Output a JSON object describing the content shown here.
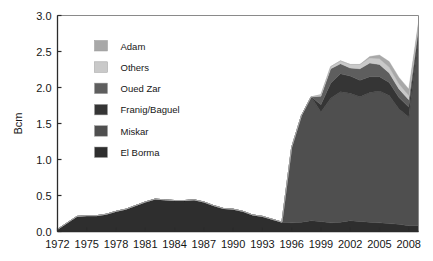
{
  "figure": {
    "background_color": "#ffffff",
    "frame_color": "#8a8a8a",
    "axis_color": "#2b2b2b"
  },
  "chart_data": {
    "type": "area",
    "stacked": true,
    "title": "",
    "subtitle": "",
    "xlabel": "",
    "ylabel": "Bcm",
    "grid": false,
    "legend_position": "upper-left-inside",
    "xlim": [
      1972,
      2009
    ],
    "ylim": [
      0.0,
      3.0
    ],
    "ytick_labels": [
      "0.0",
      "0.5",
      "1.0",
      "1.5",
      "2.0",
      "2.5",
      "3.0"
    ],
    "ytick_values": [
      0.0,
      0.5,
      1.0,
      1.5,
      2.0,
      2.5,
      3.0
    ],
    "xtick_labels": [
      "1972",
      "1975",
      "1978",
      "1981",
      "1984",
      "1987",
      "1990",
      "1993",
      "1996",
      "1999",
      "2002",
      "2005",
      "2008"
    ],
    "xtick_values": [
      1972,
      1975,
      1978,
      1981,
      1984,
      1987,
      1990,
      1993,
      1996,
      1999,
      2002,
      2005,
      2008
    ],
    "x": [
      1972,
      1973,
      1974,
      1975,
      1976,
      1977,
      1978,
      1979,
      1980,
      1981,
      1982,
      1983,
      1984,
      1985,
      1986,
      1987,
      1988,
      1989,
      1990,
      1991,
      1992,
      1993,
      1994,
      1995,
      1996,
      1997,
      1998,
      1999,
      2000,
      2001,
      2002,
      2003,
      2004,
      2005,
      2006,
      2007,
      2008,
      2009
    ],
    "series": [
      {
        "name": "El Borma",
        "color": "#2e2e2e",
        "values": [
          0.03,
          0.12,
          0.21,
          0.22,
          0.22,
          0.24,
          0.28,
          0.31,
          0.36,
          0.41,
          0.45,
          0.44,
          0.43,
          0.43,
          0.44,
          0.41,
          0.36,
          0.32,
          0.31,
          0.28,
          0.23,
          0.21,
          0.17,
          0.13,
          0.12,
          0.13,
          0.15,
          0.14,
          0.12,
          0.13,
          0.15,
          0.14,
          0.13,
          0.12,
          0.11,
          0.1,
          0.08,
          0.08
        ]
      },
      {
        "name": "Miskar",
        "color": "#4f4f4f",
        "values": [
          0,
          0,
          0,
          0,
          0,
          0,
          0,
          0,
          0,
          0,
          0,
          0,
          0,
          0,
          0,
          0,
          0,
          0,
          0,
          0,
          0,
          0,
          0,
          0,
          1.05,
          1.48,
          1.72,
          1.52,
          1.73,
          1.81,
          1.77,
          1.73,
          1.8,
          1.83,
          1.78,
          1.6,
          1.51,
          2.62
        ]
      },
      {
        "name": "Franig/Baguel",
        "color": "#353535",
        "values": [
          0,
          0,
          0,
          0,
          0,
          0,
          0,
          0,
          0,
          0,
          0,
          0,
          0,
          0,
          0,
          0,
          0,
          0,
          0,
          0,
          0,
          0,
          0,
          0,
          0.0,
          0.0,
          0.0,
          0.1,
          0.21,
          0.25,
          0.24,
          0.23,
          0.22,
          0.2,
          0.18,
          0.16,
          0.14,
          0.08
        ]
      },
      {
        "name": "Oued Zar",
        "color": "#5e5e5e",
        "values": [
          0,
          0,
          0,
          0,
          0,
          0,
          0,
          0,
          0,
          0,
          0,
          0,
          0,
          0,
          0,
          0,
          0,
          0,
          0,
          0,
          0,
          0,
          0,
          0,
          0.0,
          0.0,
          0.0,
          0.12,
          0.2,
          0.14,
          0.11,
          0.16,
          0.19,
          0.17,
          0.13,
          0.12,
          0.1,
          0.06
        ]
      },
      {
        "name": "Others",
        "color": "#c9c9c9",
        "values": [
          0,
          0,
          0,
          0,
          0,
          0,
          0,
          0,
          0,
          0,
          0,
          0,
          0,
          0,
          0,
          0,
          0,
          0,
          0,
          0,
          0,
          0,
          0,
          0,
          0.0,
          0.0,
          0.0,
          0.02,
          0.03,
          0.04,
          0.05,
          0.06,
          0.07,
          0.08,
          0.08,
          0.07,
          0.06,
          0.04
        ]
      },
      {
        "name": "Adam",
        "color": "#a8a8a8",
        "values": [
          0,
          0,
          0,
          0,
          0,
          0,
          0,
          0,
          0,
          0,
          0,
          0,
          0,
          0,
          0,
          0,
          0,
          0,
          0,
          0,
          0,
          0,
          0,
          0,
          0.0,
          0.0,
          0.0,
          0.0,
          0.0,
          0.0,
          0.0,
          0.0,
          0.02,
          0.05,
          0.08,
          0.09,
          0.09,
          0.02
        ]
      }
    ],
    "legend_order_top_to_bottom": [
      {
        "label": "Adam",
        "color": "#a8a8a8"
      },
      {
        "label": "Others",
        "color": "#c9c9c9"
      },
      {
        "label": "Oued Zar",
        "color": "#5e5e5e"
      },
      {
        "label": "Franig/Baguel",
        "color": "#353535"
      },
      {
        "label": "Miskar",
        "color": "#4f4f4f"
      },
      {
        "label": "El Borma",
        "color": "#2e2e2e"
      }
    ]
  }
}
